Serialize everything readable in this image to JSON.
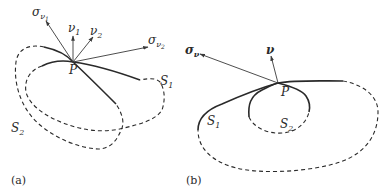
{
  "figure": {
    "panel_a": {
      "caption": "(a)",
      "point_label": "P",
      "surface_1_label": "S",
      "surface_1_sub": "1",
      "surface_2_label": "S",
      "surface_2_sub": "2",
      "vectors": [
        {
          "label": "σ",
          "sub": "ν",
          "subsub": "1",
          "kind": "stress-vector"
        },
        {
          "label": "ν",
          "sub": "1",
          "kind": "normal"
        },
        {
          "label": "ν",
          "sub": "2",
          "kind": "normal"
        },
        {
          "label": "σ",
          "sub": "ν",
          "subsub": "2",
          "kind": "stress-vector"
        }
      ]
    },
    "panel_b": {
      "caption": "(b)",
      "point_label": "P",
      "surface_1_label": "S",
      "surface_1_sub": "1",
      "surface_2_label": "S",
      "surface_2_sub": "2",
      "vectors": [
        {
          "label": "σ",
          "sub": "ν",
          "kind": "stress-vector"
        },
        {
          "label": "ν",
          "kind": "normal"
        }
      ]
    },
    "colors": {
      "stroke": "#2a2a2a",
      "arrow": "#555555",
      "background": "#ffffff"
    }
  }
}
